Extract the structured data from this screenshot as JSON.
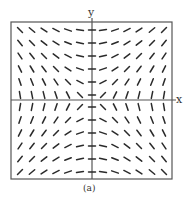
{
  "chart_data": {
    "type": "slope_field",
    "title": "",
    "caption": "(a)",
    "xlabel": "x",
    "ylabel": "y",
    "equation_estimate": "dy/dx = x / y",
    "grid": false,
    "x_values": [
      -6,
      -5,
      -4,
      -3,
      -2,
      -1,
      0,
      1,
      2,
      3,
      4,
      5,
      6
    ],
    "y_values": [
      6,
      5,
      4,
      3,
      2,
      1,
      -1,
      -2,
      -3,
      -4,
      -5,
      -6
    ],
    "xlim": [
      -6.5,
      6.5
    ],
    "ylim": [
      -6.5,
      6.5
    ],
    "quadrant_signs": {
      "upper_left": "negative",
      "upper_right": "positive",
      "lower_left": "positive",
      "lower_right": "negative"
    }
  },
  "layout": {
    "box": {
      "left": 11,
      "top": 22,
      "right": 172,
      "bottom": 179
    },
    "axis_x_px": 92,
    "axis_y_px": 100,
    "col_px": [
      20,
      32,
      44,
      56,
      68,
      80,
      92,
      103,
      115,
      127,
      139,
      152,
      164
    ],
    "row_px": [
      30,
      43,
      56,
      69,
      82,
      95,
      107,
      120,
      133,
      146,
      159,
      172
    ],
    "seg_len": 7,
    "stroke": "#2a2a2a",
    "frame": "#555555"
  },
  "labels": {
    "x": "x",
    "y": "y",
    "caption": "(a)"
  }
}
